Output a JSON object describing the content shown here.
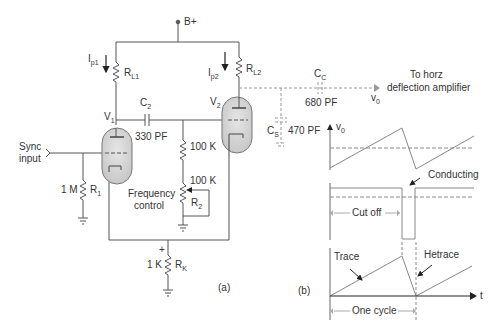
{
  "diagram": {
    "panel_a_label": "(a)",
    "panel_b_label": "(b)",
    "supply": "B+",
    "currents": {
      "ip1": "I",
      "ip1_sub": "p1",
      "ip2": "I",
      "ip2_sub": "p2"
    },
    "resistors": {
      "rl1": "R",
      "rl1_sub": "L1",
      "rl2": "R",
      "rl2_sub": "L2",
      "r1": "R",
      "r1_sub": "1",
      "r1_value": "1 M",
      "r2": "R",
      "r2_sub": "2",
      "rk": "R",
      "rk_sub": "K",
      "rk_value": "1 K",
      "grid_res_value": "100 K",
      "pot_value": "100 K"
    },
    "tubes": {
      "v1": "V",
      "v1_sub": "1",
      "v2": "V",
      "v2_sub": "2"
    },
    "capacitors": {
      "c2": "C",
      "c2_sub": "2",
      "c2_value": "330 PF",
      "cc": "C",
      "cc_sub": "C",
      "cc_value": "680 PF",
      "cs": "C",
      "cs_sub": "S",
      "cs_value": "470 PF"
    },
    "input_label_line1": "Sync",
    "input_label_line2": "input",
    "frequency_control_line1": "Frequency",
    "frequency_control_line2": "control",
    "cathode_plus": "+",
    "output_label_line1": "To horz",
    "output_label_line2": "deflection amplifier",
    "output_v": "v",
    "output_v_sub": "0",
    "waveforms": {
      "v0_axis": "v",
      "v0_axis_sub": "0",
      "conducting": "Conducting",
      "cut_off": "Cut off",
      "trace": "Trace",
      "retrace": "Hetrace",
      "t_axis": "t",
      "one_cycle": "One cycle"
    }
  }
}
